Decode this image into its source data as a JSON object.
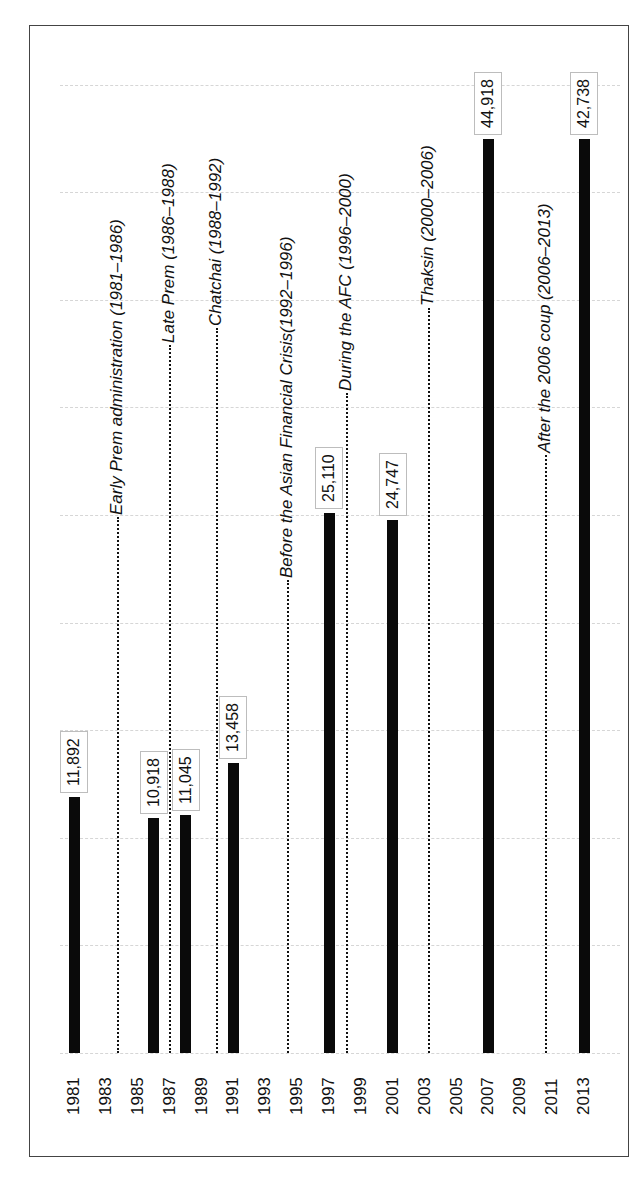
{
  "chart_data": {
    "type": "bar",
    "orientation": "rotated-90-ccw",
    "title": "",
    "xlabel": "",
    "ylabel": "",
    "ylim": [
      0,
      45000
    ],
    "grid": true,
    "gridline_step": 5000,
    "x_ticks": [
      "1981",
      "1983",
      "1985",
      "1987",
      "1989",
      "1991",
      "1993",
      "1995",
      "1997",
      "1999",
      "2001",
      "2003",
      "2005",
      "2007",
      "2009",
      "2011",
      "2013"
    ],
    "categories": [
      "1981",
      "1986",
      "1988",
      "1991",
      "1997",
      "2001",
      "2007",
      "2013"
    ],
    "values": [
      11892,
      10918,
      11045,
      13458,
      25110,
      24747,
      44918,
      42738
    ],
    "value_labels": [
      "11,892",
      "10,918",
      "11,045",
      "13,458",
      "25,110",
      "24,747",
      "44,918",
      "42,738"
    ],
    "annotations": [
      {
        "text": "Early Prem administration (1981–1986)",
        "x": 1983.75
      },
      {
        "text": "Late Prem (1986–1988)",
        "x": 1987.0
      },
      {
        "text": "Chatchai (1988–1992)",
        "x": 1990.0
      },
      {
        "text": "Before the Asian Financial Crisis(1992–1996)",
        "x": 1994.4
      },
      {
        "text": "During the AFC (1996–2000)",
        "x": 1998.1
      },
      {
        "text": "Thaksin (2000–2006)",
        "x": 2003.3
      },
      {
        "text": "After the 2006 coup (2006–2013)",
        "x": 2010.6
      }
    ],
    "legend": null
  }
}
